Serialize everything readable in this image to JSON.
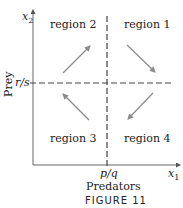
{
  "figure": {
    "caption": "FIGURE 11",
    "x_axis": {
      "variable": "x",
      "subscript": "1",
      "label": "Predators",
      "tick_label": "p/q"
    },
    "y_axis": {
      "variable": "x",
      "subscript": "2",
      "label": "Prey",
      "tick_label": "r/s"
    },
    "regions": [
      {
        "label": "region 1",
        "arrow_direction": "down-right"
      },
      {
        "label": "region 2",
        "arrow_direction": "up-right"
      },
      {
        "label": "region 3",
        "arrow_direction": "up-left"
      },
      {
        "label": "region 4",
        "arrow_direction": "down-left"
      }
    ],
    "colors": {
      "axis": "#555555",
      "dashes": "#444444",
      "arrows": "#8a8a8a",
      "text": "#222222"
    }
  }
}
